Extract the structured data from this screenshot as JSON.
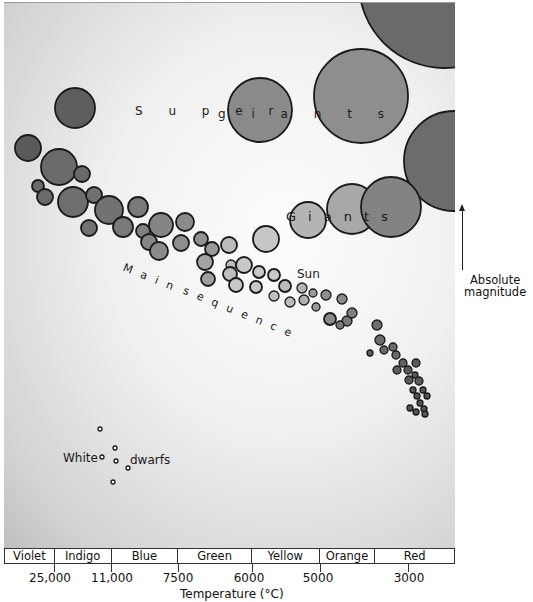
{
  "labels": {
    "supergiants": "Supergiants",
    "giants": "Giants",
    "main_sequence": "Main sequence",
    "sun": "Sun",
    "white": "White",
    "dwarfs": "dwarfs"
  },
  "y_axis": {
    "label_line1": "Absolute",
    "label_line2": "magnitude",
    "direction": "up"
  },
  "x_axis": {
    "title": "Temperature (°C)",
    "ticks": [
      {
        "label": "25,000",
        "x": 54
      },
      {
        "label": "11,000",
        "x": 111
      },
      {
        "label": "7500",
        "x": 178
      },
      {
        "label": "6000",
        "x": 252
      },
      {
        "label": "5000",
        "x": 320
      },
      {
        "label": "3000",
        "x": 408
      }
    ]
  },
  "color_band": [
    {
      "label": "Violet",
      "width": 50
    },
    {
      "label": "Indigo",
      "width": 57
    },
    {
      "label": "Blue",
      "width": 67
    },
    {
      "label": "Green",
      "width": 74
    },
    {
      "label": "Yellow",
      "width": 68
    },
    {
      "label": "Orange",
      "width": 56
    },
    {
      "label": "Red",
      "width": 79
    }
  ],
  "chart_data": {
    "type": "scatter",
    "xlabel": "Temperature (°C)",
    "ylabel": "Absolute magnitude",
    "x_ticks": [
      "25,000",
      "11,000",
      "7500",
      "6000",
      "5000",
      "3000"
    ],
    "color_bands": [
      "Violet",
      "Indigo",
      "Blue",
      "Green",
      "Yellow",
      "Orange",
      "Red"
    ],
    "groups": [
      "Supergiants",
      "Giants",
      "Main sequence",
      "White dwarfs"
    ],
    "annotations": [
      "Sun"
    ]
  }
}
